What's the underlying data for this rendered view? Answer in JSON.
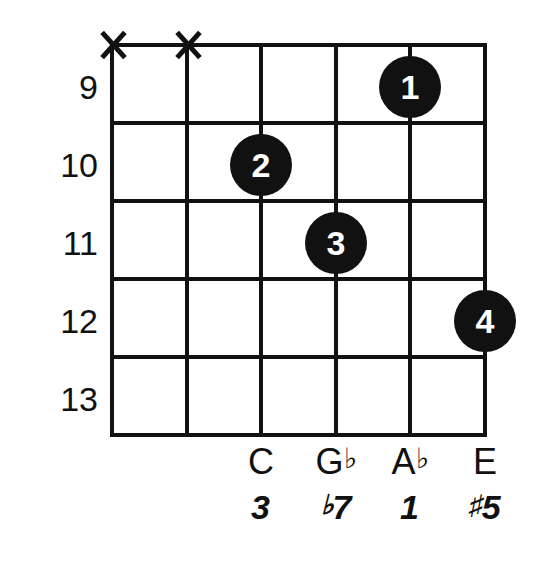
{
  "diagram": {
    "type": "guitar-chord-diagram",
    "title": "",
    "start_fret": 9,
    "fret_numbers": [
      "9",
      "10",
      "11",
      "12",
      "13"
    ],
    "string_count": 6,
    "fret_count": 5,
    "line_color": "#111111",
    "dot_color": "#111111",
    "dot_text_color": "#ffffff",
    "background": "#ffffff",
    "muted_strings": [
      {
        "string": 1,
        "marker": "X"
      },
      {
        "string": 2,
        "marker": "X"
      }
    ],
    "fingerings": [
      {
        "finger": "1",
        "string": 5,
        "fret": 9
      },
      {
        "finger": "2",
        "string": 3,
        "fret": 10
      },
      {
        "finger": "3",
        "string": 4,
        "fret": 11
      },
      {
        "finger": "4",
        "string": 6,
        "fret": 12
      }
    ],
    "notes": [
      {
        "string": 3,
        "name": "C",
        "accidental": ""
      },
      {
        "string": 4,
        "name": "G",
        "accidental": "♭"
      },
      {
        "string": 5,
        "name": "A",
        "accidental": "♭"
      },
      {
        "string": 6,
        "name": "E",
        "accidental": ""
      }
    ],
    "intervals": [
      {
        "string": 3,
        "accidental": "",
        "degree": "3"
      },
      {
        "string": 4,
        "accidental": "♭",
        "degree": "7"
      },
      {
        "string": 5,
        "accidental": "",
        "degree": "1"
      },
      {
        "string": 6,
        "accidental": "♯",
        "degree": "5"
      }
    ]
  }
}
